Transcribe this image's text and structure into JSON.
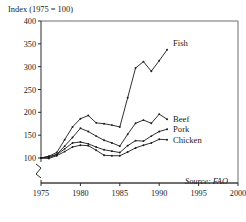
{
  "chart_data": {
    "type": "line",
    "title": "Index (1975 = 100)",
    "xlabel": "",
    "ylabel": "",
    "xlim": [
      1975,
      2000
    ],
    "ylim": [
      100,
      400
    ],
    "yticks": [
      100,
      150,
      200,
      250,
      300,
      350,
      400
    ],
    "xticks": [
      1975,
      1980,
      1985,
      1990,
      1995,
      2000
    ],
    "grid": false,
    "axis_break": true,
    "legend_position": "inline-right",
    "annotations": [
      "Source: FAO"
    ],
    "x": [
      1975,
      1976,
      1977,
      1978,
      1979,
      1980,
      1981,
      1982,
      1983,
      1984,
      1985,
      1986,
      1987,
      1988,
      1989,
      1990,
      1991
    ],
    "series": [
      {
        "name": "Fish",
        "label": "Fish",
        "values": [
          100,
          104,
          112,
          140,
          168,
          186,
          193,
          177,
          175,
          172,
          168,
          232,
          297,
          311,
          290,
          313,
          337
        ]
      },
      {
        "name": "Beef",
        "label": "Beef",
        "values": [
          100,
          103,
          108,
          126,
          145,
          165,
          158,
          148,
          139,
          133,
          126,
          152,
          176,
          183,
          176,
          196,
          185
        ]
      },
      {
        "name": "Pork",
        "label": "Pork",
        "values": [
          100,
          101,
          107,
          120,
          133,
          135,
          131,
          124,
          118,
          115,
          112,
          127,
          138,
          137,
          148,
          158,
          163
        ]
      },
      {
        "name": "Chicken",
        "label": "Chicken",
        "values": [
          100,
          99,
          105,
          114,
          124,
          128,
          127,
          117,
          106,
          105,
          105,
          113,
          122,
          128,
          133,
          141,
          140
        ]
      }
    ]
  },
  "source": {
    "note": "Source: FAO"
  },
  "ticks": {
    "y": [
      "400",
      "350",
      "300",
      "250",
      "200",
      "150",
      "100"
    ],
    "x": [
      "1975",
      "1980",
      "1985",
      "1990",
      "1995",
      "2000"
    ]
  },
  "labels": {
    "fish": "Fish",
    "beef": "Beef",
    "pork": "Pork",
    "chicken": "Chicken",
    "title": "Index (1975 = 100)"
  }
}
